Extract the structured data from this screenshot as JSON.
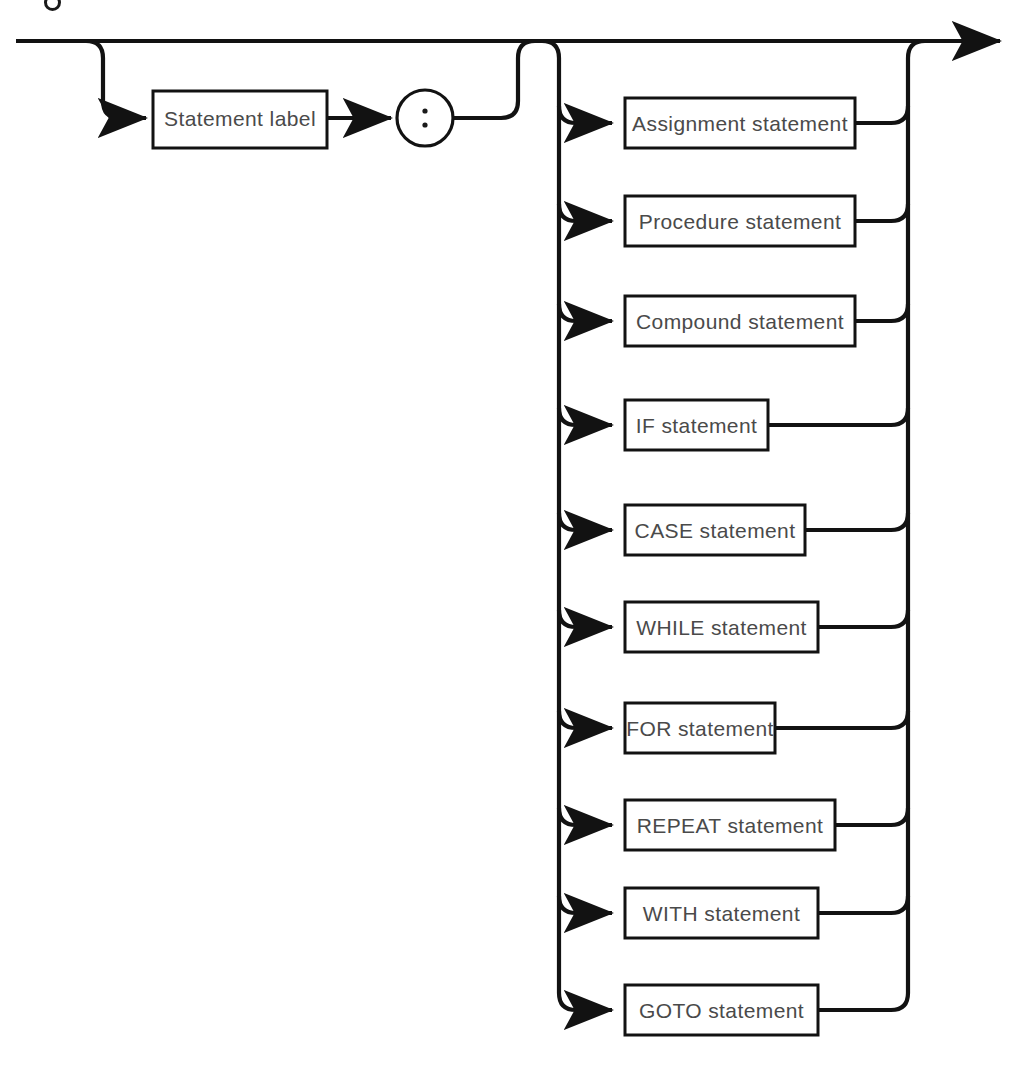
{
  "diagram": {
    "type": "railroad-syntax-diagram",
    "title": "Statement",
    "entry_label": "",
    "geometry": {
      "width": 1031,
      "height": 1089,
      "main_line_y": 41,
      "main_line_x_start": 16,
      "arrow_tip_x": 1012,
      "label_branch_x": 103,
      "label_row_y": 118,
      "colon_join_x": 518,
      "left_rail_x": 559,
      "right_rail_x": 908,
      "box_left_x": 625,
      "arrow_x": 620,
      "corner_radius": 17
    },
    "colors": {
      "line": "#121212",
      "box_stroke": "#121212",
      "box_fill": "#ffffff",
      "text": "#4a4a4a",
      "background": "#ffffff"
    },
    "optional_prefix": {
      "box_label": "Statement label",
      "separator_label": ":",
      "separator_shape": "circle",
      "box": {
        "x": 153,
        "y": 91,
        "w": 174,
        "h": 57
      },
      "circle": {
        "cx": 425,
        "cy": 118,
        "r": 28
      }
    },
    "alternatives": [
      {
        "label": "Assignment statement",
        "y": 98,
        "h": 50,
        "x": 625,
        "w": 230
      },
      {
        "label": "Procedure statement",
        "y": 196,
        "h": 50,
        "x": 625,
        "w": 230
      },
      {
        "label": "Compound statement",
        "y": 296,
        "h": 50,
        "x": 625,
        "w": 230
      },
      {
        "label": "IF statement",
        "y": 400,
        "h": 50,
        "x": 625,
        "w": 143
      },
      {
        "label": "CASE statement",
        "y": 505,
        "h": 50,
        "x": 625,
        "w": 180
      },
      {
        "label": "WHILE statement",
        "y": 602,
        "h": 50,
        "x": 625,
        "w": 193
      },
      {
        "label": "FOR statement",
        "y": 703,
        "h": 50,
        "x": 625,
        "w": 150
      },
      {
        "label": "REPEAT statement",
        "y": 800,
        "h": 50,
        "x": 625,
        "w": 210
      },
      {
        "label": "WITH statement",
        "y": 888,
        "h": 50,
        "x": 625,
        "w": 193
      },
      {
        "label": "GOTO statement",
        "y": 985,
        "h": 50,
        "x": 625,
        "w": 193
      }
    ]
  }
}
